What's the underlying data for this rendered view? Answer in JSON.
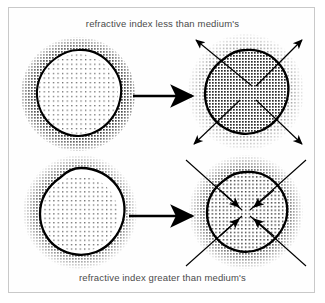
{
  "figure": {
    "width": 325,
    "height": 303,
    "background_color": "#ffffff",
    "frame_color": "#c9c9c9",
    "ink_color": "#000000",
    "stipple_color": "#3a3a3a",
    "caption_color": "#4a4a4a"
  },
  "captions": {
    "top": "refractive index less than medium's",
    "bottom": "refractive index greater than medium's"
  },
  "diagram_data": {
    "type": "scientific-illustration",
    "subject": "Light interaction with a particle whose refractive index differs from the surrounding medium",
    "rows": [
      {
        "id": "row-top",
        "caption": "refractive index less than medium's",
        "arrow_direction": "outward",
        "description": "Particle with lower refractive index than the medium; rays diverge away from the particle centre.",
        "before": {
          "id": "top-left-particle",
          "interior_density": "sparse",
          "exterior_density": "dense",
          "outline": "irregular-blob"
        },
        "after": {
          "id": "top-right-particle",
          "interior_density": "dense",
          "exterior_density": "medium",
          "outline": "irregular-blob",
          "ray_count": 4,
          "ray_arrowheads": "outer-ends"
        }
      },
      {
        "id": "row-bottom",
        "caption": "refractive index greater than medium's",
        "arrow_direction": "inward",
        "description": "Particle with higher refractive index than the medium; rays converge toward the particle centre.",
        "before": {
          "id": "bottom-left-particle",
          "interior_density": "sparse",
          "exterior_density": "dense",
          "outline": "irregular-blob"
        },
        "after": {
          "id": "bottom-right-particle",
          "interior_density": "medium",
          "exterior_density": "dense",
          "outline": "irregular-blob",
          "ray_count": 4,
          "ray_arrowheads": "inner-ends"
        }
      }
    ],
    "transition_arrows": [
      {
        "id": "transition-arrow-top",
        "direction": "right"
      },
      {
        "id": "transition-arrow-bottom",
        "direction": "right"
      }
    ]
  }
}
